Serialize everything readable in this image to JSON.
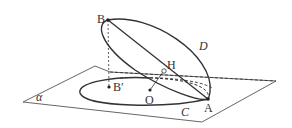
{
  "diagram": {
    "type": "3d-geometry",
    "labels": {
      "B": "B",
      "A": "A",
      "H": "H",
      "O": "O",
      "B_prime": "B′",
      "D": "D",
      "C": "C",
      "alpha": "α"
    },
    "points": {
      "B": [
        108,
        20
      ],
      "A": [
        208,
        99
      ],
      "H": [
        164,
        71
      ],
      "O": [
        150,
        90
      ],
      "B_prime": [
        110,
        87
      ]
    },
    "colors": {
      "stroke": "#333333",
      "plane_stroke": "#555555"
    }
  }
}
